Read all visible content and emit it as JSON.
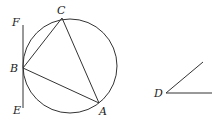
{
  "figure": {
    "circle": {
      "cx": 70,
      "cy": 66,
      "r": 47
    },
    "points": {
      "A": {
        "label": "A",
        "x": 99,
        "y": 103
      },
      "B": {
        "label": "B",
        "x": 23,
        "y": 68
      },
      "C": {
        "label": "C",
        "x": 62,
        "y": 18
      },
      "E": {
        "label": "E",
        "x": 23,
        "y": 108
      },
      "F": {
        "label": "F",
        "x": 23,
        "y": 25
      },
      "D": {
        "label": "D",
        "x": 166,
        "y": 93
      }
    },
    "tangent_line": "EF tangent to circle at B",
    "triangle": "ABC inscribed in circle",
    "angle": "angle at D",
    "colors": {
      "stroke": "#333333",
      "text": "#222222",
      "background": "#ffffff"
    }
  }
}
